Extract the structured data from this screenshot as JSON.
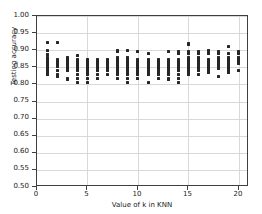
{
  "chart_data": {
    "type": "scatter",
    "title": "",
    "xlabel": "Value of k in KNN",
    "ylabel": "Testing accuracy",
    "xlim": [
      0,
      21
    ],
    "ylim": [
      0.5,
      1.0
    ],
    "xticks": [
      0,
      5,
      10,
      15,
      20
    ],
    "xtick_labels": [
      "0",
      "5",
      "10",
      "15",
      "20"
    ],
    "yticks": [
      0.5,
      0.55,
      0.6,
      0.65,
      0.7,
      0.75,
      0.8,
      0.85,
      0.9,
      0.95,
      1.0
    ],
    "ytick_labels": [
      "0.50",
      "0.55",
      "0.60",
      "0.65",
      "0.70",
      "0.75",
      "0.80",
      "0.85",
      "0.90",
      "0.95",
      "1.00"
    ],
    "grid": true,
    "grid_axis": "both",
    "marker": "square-dot",
    "marker_color": "#262626",
    "marker_size": 3,
    "legend": null,
    "series": [
      {
        "name": "testing accuracy per fold",
        "points": [
          {
            "x": 1,
            "y": 0.923
          },
          {
            "x": 1,
            "y": 0.9
          },
          {
            "x": 1,
            "y": 0.886
          },
          {
            "x": 1,
            "y": 0.878
          },
          {
            "x": 1,
            "y": 0.873
          },
          {
            "x": 1,
            "y": 0.868
          },
          {
            "x": 1,
            "y": 0.862
          },
          {
            "x": 1,
            "y": 0.857
          },
          {
            "x": 1,
            "y": 0.851
          },
          {
            "x": 1,
            "y": 0.846
          },
          {
            "x": 1,
            "y": 0.84
          },
          {
            "x": 1,
            "y": 0.835
          },
          {
            "x": 1,
            "y": 0.829
          },
          {
            "x": 2,
            "y": 0.923
          },
          {
            "x": 2,
            "y": 0.873
          },
          {
            "x": 2,
            "y": 0.868
          },
          {
            "x": 2,
            "y": 0.862
          },
          {
            "x": 2,
            "y": 0.857
          },
          {
            "x": 2,
            "y": 0.851
          },
          {
            "x": 2,
            "y": 0.84
          },
          {
            "x": 2,
            "y": 0.829
          },
          {
            "x": 2,
            "y": 0.824
          },
          {
            "x": 3,
            "y": 0.878
          },
          {
            "x": 3,
            "y": 0.873
          },
          {
            "x": 3,
            "y": 0.868
          },
          {
            "x": 3,
            "y": 0.862
          },
          {
            "x": 3,
            "y": 0.857
          },
          {
            "x": 3,
            "y": 0.851
          },
          {
            "x": 3,
            "y": 0.846
          },
          {
            "x": 3,
            "y": 0.84
          },
          {
            "x": 3,
            "y": 0.818
          },
          {
            "x": 3,
            "y": 0.813
          },
          {
            "x": 4,
            "y": 0.884
          },
          {
            "x": 4,
            "y": 0.873
          },
          {
            "x": 4,
            "y": 0.868
          },
          {
            "x": 4,
            "y": 0.862
          },
          {
            "x": 4,
            "y": 0.857
          },
          {
            "x": 4,
            "y": 0.851
          },
          {
            "x": 4,
            "y": 0.846
          },
          {
            "x": 4,
            "y": 0.84
          },
          {
            "x": 4,
            "y": 0.829
          },
          {
            "x": 4,
            "y": 0.818
          },
          {
            "x": 4,
            "y": 0.807
          },
          {
            "x": 5,
            "y": 0.873
          },
          {
            "x": 5,
            "y": 0.868
          },
          {
            "x": 5,
            "y": 0.862
          },
          {
            "x": 5,
            "y": 0.857
          },
          {
            "x": 5,
            "y": 0.851
          },
          {
            "x": 5,
            "y": 0.846
          },
          {
            "x": 5,
            "y": 0.84
          },
          {
            "x": 5,
            "y": 0.835
          },
          {
            "x": 5,
            "y": 0.829
          },
          {
            "x": 5,
            "y": 0.818
          },
          {
            "x": 5,
            "y": 0.807
          },
          {
            "x": 6,
            "y": 0.873
          },
          {
            "x": 6,
            "y": 0.868
          },
          {
            "x": 6,
            "y": 0.862
          },
          {
            "x": 6,
            "y": 0.857
          },
          {
            "x": 6,
            "y": 0.851
          },
          {
            "x": 6,
            "y": 0.846
          },
          {
            "x": 6,
            "y": 0.84
          },
          {
            "x": 6,
            "y": 0.829
          },
          {
            "x": 6,
            "y": 0.818
          },
          {
            "x": 7,
            "y": 0.873
          },
          {
            "x": 7,
            "y": 0.868
          },
          {
            "x": 7,
            "y": 0.862
          },
          {
            "x": 7,
            "y": 0.857
          },
          {
            "x": 7,
            "y": 0.851
          },
          {
            "x": 7,
            "y": 0.846
          },
          {
            "x": 7,
            "y": 0.84
          },
          {
            "x": 7,
            "y": 0.829
          },
          {
            "x": 8,
            "y": 0.9
          },
          {
            "x": 8,
            "y": 0.895
          },
          {
            "x": 8,
            "y": 0.878
          },
          {
            "x": 8,
            "y": 0.873
          },
          {
            "x": 8,
            "y": 0.868
          },
          {
            "x": 8,
            "y": 0.862
          },
          {
            "x": 8,
            "y": 0.857
          },
          {
            "x": 8,
            "y": 0.851
          },
          {
            "x": 8,
            "y": 0.846
          },
          {
            "x": 8,
            "y": 0.84
          },
          {
            "x": 8,
            "y": 0.835
          },
          {
            "x": 8,
            "y": 0.829
          },
          {
            "x": 8,
            "y": 0.818
          },
          {
            "x": 9,
            "y": 0.9
          },
          {
            "x": 9,
            "y": 0.878
          },
          {
            "x": 9,
            "y": 0.873
          },
          {
            "x": 9,
            "y": 0.868
          },
          {
            "x": 9,
            "y": 0.862
          },
          {
            "x": 9,
            "y": 0.857
          },
          {
            "x": 9,
            "y": 0.851
          },
          {
            "x": 9,
            "y": 0.846
          },
          {
            "x": 9,
            "y": 0.84
          },
          {
            "x": 9,
            "y": 0.835
          },
          {
            "x": 9,
            "y": 0.829
          },
          {
            "x": 9,
            "y": 0.818
          },
          {
            "x": 9,
            "y": 0.807
          },
          {
            "x": 10,
            "y": 0.895
          },
          {
            "x": 10,
            "y": 0.873
          },
          {
            "x": 10,
            "y": 0.868
          },
          {
            "x": 10,
            "y": 0.862
          },
          {
            "x": 10,
            "y": 0.857
          },
          {
            "x": 10,
            "y": 0.851
          },
          {
            "x": 10,
            "y": 0.846
          },
          {
            "x": 10,
            "y": 0.84
          },
          {
            "x": 10,
            "y": 0.835
          },
          {
            "x": 10,
            "y": 0.829
          },
          {
            "x": 10,
            "y": 0.818
          },
          {
            "x": 11,
            "y": 0.889
          },
          {
            "x": 11,
            "y": 0.873
          },
          {
            "x": 11,
            "y": 0.868
          },
          {
            "x": 11,
            "y": 0.862
          },
          {
            "x": 11,
            "y": 0.857
          },
          {
            "x": 11,
            "y": 0.851
          },
          {
            "x": 11,
            "y": 0.846
          },
          {
            "x": 11,
            "y": 0.84
          },
          {
            "x": 11,
            "y": 0.835
          },
          {
            "x": 11,
            "y": 0.829
          },
          {
            "x": 11,
            "y": 0.807
          },
          {
            "x": 12,
            "y": 0.873
          },
          {
            "x": 12,
            "y": 0.868
          },
          {
            "x": 12,
            "y": 0.862
          },
          {
            "x": 12,
            "y": 0.857
          },
          {
            "x": 12,
            "y": 0.851
          },
          {
            "x": 12,
            "y": 0.846
          },
          {
            "x": 12,
            "y": 0.84
          },
          {
            "x": 12,
            "y": 0.835
          },
          {
            "x": 12,
            "y": 0.829
          },
          {
            "x": 12,
            "y": 0.818
          },
          {
            "x": 13,
            "y": 0.895
          },
          {
            "x": 13,
            "y": 0.873
          },
          {
            "x": 13,
            "y": 0.868
          },
          {
            "x": 13,
            "y": 0.862
          },
          {
            "x": 13,
            "y": 0.857
          },
          {
            "x": 13,
            "y": 0.851
          },
          {
            "x": 13,
            "y": 0.846
          },
          {
            "x": 13,
            "y": 0.84
          },
          {
            "x": 13,
            "y": 0.835
          },
          {
            "x": 13,
            "y": 0.829
          },
          {
            "x": 13,
            "y": 0.818
          },
          {
            "x": 13,
            "y": 0.813
          },
          {
            "x": 14,
            "y": 0.895
          },
          {
            "x": 14,
            "y": 0.889
          },
          {
            "x": 14,
            "y": 0.873
          },
          {
            "x": 14,
            "y": 0.868
          },
          {
            "x": 14,
            "y": 0.862
          },
          {
            "x": 14,
            "y": 0.857
          },
          {
            "x": 14,
            "y": 0.851
          },
          {
            "x": 14,
            "y": 0.846
          },
          {
            "x": 14,
            "y": 0.84
          },
          {
            "x": 14,
            "y": 0.829
          },
          {
            "x": 14,
            "y": 0.818
          },
          {
            "x": 14,
            "y": 0.807
          },
          {
            "x": 15,
            "y": 0.921
          },
          {
            "x": 15,
            "y": 0.916
          },
          {
            "x": 15,
            "y": 0.895
          },
          {
            "x": 15,
            "y": 0.889
          },
          {
            "x": 15,
            "y": 0.878
          },
          {
            "x": 15,
            "y": 0.873
          },
          {
            "x": 15,
            "y": 0.868
          },
          {
            "x": 15,
            "y": 0.862
          },
          {
            "x": 15,
            "y": 0.857
          },
          {
            "x": 15,
            "y": 0.851
          },
          {
            "x": 15,
            "y": 0.846
          },
          {
            "x": 15,
            "y": 0.84
          },
          {
            "x": 15,
            "y": 0.835
          },
          {
            "x": 15,
            "y": 0.829
          },
          {
            "x": 16,
            "y": 0.895
          },
          {
            "x": 16,
            "y": 0.889
          },
          {
            "x": 16,
            "y": 0.878
          },
          {
            "x": 16,
            "y": 0.873
          },
          {
            "x": 16,
            "y": 0.868
          },
          {
            "x": 16,
            "y": 0.862
          },
          {
            "x": 16,
            "y": 0.857
          },
          {
            "x": 16,
            "y": 0.851
          },
          {
            "x": 16,
            "y": 0.846
          },
          {
            "x": 16,
            "y": 0.84
          },
          {
            "x": 16,
            "y": 0.829
          },
          {
            "x": 17,
            "y": 0.9
          },
          {
            "x": 17,
            "y": 0.895
          },
          {
            "x": 17,
            "y": 0.889
          },
          {
            "x": 17,
            "y": 0.873
          },
          {
            "x": 17,
            "y": 0.868
          },
          {
            "x": 17,
            "y": 0.862
          },
          {
            "x": 17,
            "y": 0.857
          },
          {
            "x": 17,
            "y": 0.851
          },
          {
            "x": 17,
            "y": 0.846
          },
          {
            "x": 17,
            "y": 0.84
          },
          {
            "x": 17,
            "y": 0.835
          },
          {
            "x": 18,
            "y": 0.895
          },
          {
            "x": 18,
            "y": 0.889
          },
          {
            "x": 18,
            "y": 0.878
          },
          {
            "x": 18,
            "y": 0.873
          },
          {
            "x": 18,
            "y": 0.868
          },
          {
            "x": 18,
            "y": 0.862
          },
          {
            "x": 18,
            "y": 0.857
          },
          {
            "x": 18,
            "y": 0.851
          },
          {
            "x": 18,
            "y": 0.846
          },
          {
            "x": 18,
            "y": 0.822
          },
          {
            "x": 19,
            "y": 0.911
          },
          {
            "x": 19,
            "y": 0.889
          },
          {
            "x": 19,
            "y": 0.878
          },
          {
            "x": 19,
            "y": 0.873
          },
          {
            "x": 19,
            "y": 0.868
          },
          {
            "x": 19,
            "y": 0.862
          },
          {
            "x": 19,
            "y": 0.857
          },
          {
            "x": 19,
            "y": 0.851
          },
          {
            "x": 19,
            "y": 0.846
          },
          {
            "x": 19,
            "y": 0.84
          },
          {
            "x": 19,
            "y": 0.835
          },
          {
            "x": 20,
            "y": 0.895
          },
          {
            "x": 20,
            "y": 0.889
          },
          {
            "x": 20,
            "y": 0.878
          },
          {
            "x": 20,
            "y": 0.873
          },
          {
            "x": 20,
            "y": 0.868
          },
          {
            "x": 20,
            "y": 0.862
          },
          {
            "x": 20,
            "y": 0.84
          }
        ]
      }
    ]
  }
}
